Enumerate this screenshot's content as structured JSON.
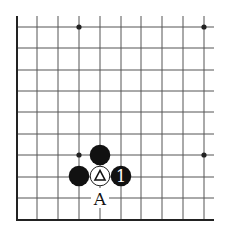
{
  "board": {
    "description": "Lower-left corner of a Go board",
    "columns_x": [
      17,
      37,
      58,
      79,
      100,
      121,
      141,
      162,
      183,
      204
    ],
    "rows_y": [
      27,
      48,
      70,
      91,
      112,
      134,
      155,
      177,
      198,
      220
    ],
    "line_color": "#555555",
    "edge_color": "#222222",
    "star_points": [
      {
        "col": 3,
        "row": 0
      },
      {
        "col": 9,
        "row": 0
      },
      {
        "col": 3,
        "row": 6
      },
      {
        "col": 9,
        "row": 6
      }
    ]
  },
  "stones": [
    {
      "color": "black",
      "col": 4,
      "row": 6,
      "label": ""
    },
    {
      "color": "black",
      "col": 3,
      "row": 7,
      "label": ""
    },
    {
      "color": "white",
      "col": 4,
      "row": 7,
      "label": "",
      "marker": "triangle"
    },
    {
      "color": "black",
      "col": 5,
      "row": 7,
      "label": "1"
    }
  ],
  "labels": [
    {
      "text": "A",
      "col": 4,
      "row": 8
    }
  ],
  "text": {
    "move_1": "1",
    "point_a": "A"
  }
}
